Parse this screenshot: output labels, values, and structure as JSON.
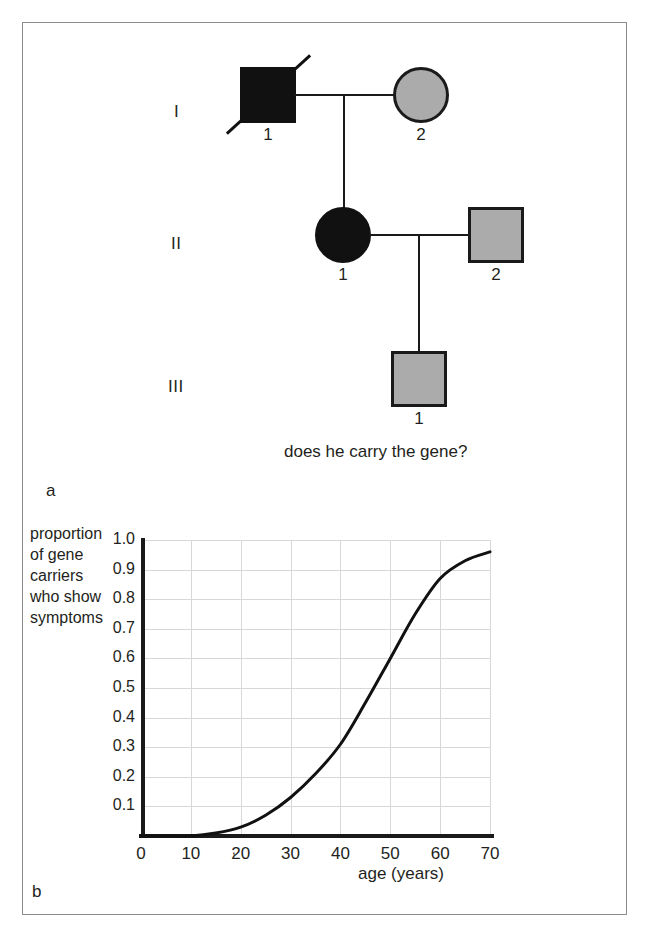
{
  "figure": {
    "panel_a_letter": "a",
    "panel_b_letter": "b",
    "caption": "does he carry the gene?"
  },
  "pedigree": {
    "generations": [
      {
        "label": "I"
      },
      {
        "label": "II"
      },
      {
        "label": "III"
      }
    ],
    "individuals": [
      {
        "generation": "I",
        "id": "1",
        "shape": "square",
        "sex": "male",
        "fill": "black",
        "deceased": true,
        "status": "affected-deceased"
      },
      {
        "generation": "I",
        "id": "2",
        "shape": "circle",
        "sex": "female",
        "fill": "gray",
        "deceased": false,
        "status": "carrier"
      },
      {
        "generation": "II",
        "id": "1",
        "shape": "circle",
        "sex": "female",
        "fill": "black",
        "deceased": false,
        "status": "affected"
      },
      {
        "generation": "II",
        "id": "2",
        "shape": "square",
        "sex": "male",
        "fill": "gray",
        "deceased": false,
        "status": "carrier"
      },
      {
        "generation": "III",
        "id": "1",
        "shape": "square",
        "sex": "male",
        "fill": "gray",
        "deceased": false,
        "status": "unknown"
      }
    ],
    "colors": {
      "affected_fill": "#111111",
      "gray_fill": "#ababab",
      "outline": "#1a1a1a"
    }
  },
  "chart_data": {
    "type": "line",
    "title": "",
    "xlabel": "age (years)",
    "ylabel": "proportion of gene carriers who show symptoms",
    "ylabel_lines": [
      "proportion",
      "of gene",
      "carriers",
      "who show",
      "symptoms"
    ],
    "xlim": [
      0,
      70
    ],
    "ylim": [
      0,
      1.0
    ],
    "grid": true,
    "legend": "none",
    "xticks": [
      "0",
      "10",
      "20",
      "30",
      "40",
      "50",
      "60",
      "70"
    ],
    "xtick_values": [
      0,
      10,
      20,
      30,
      40,
      50,
      60,
      70
    ],
    "yticks": [
      "0.1",
      "0.2",
      "0.3",
      "0.4",
      "0.5",
      "0.6",
      "0.7",
      "0.8",
      "0.9",
      "1.0"
    ],
    "ytick_values": [
      0.1,
      0.2,
      0.3,
      0.4,
      0.5,
      0.6,
      0.7,
      0.8,
      0.9,
      1.0
    ],
    "annotation_mark": ",",
    "series": [
      {
        "name": "proportion of gene carriers showing symptoms",
        "x": [
          0,
          5,
          10,
          15,
          20,
          25,
          30,
          35,
          40,
          45,
          50,
          55,
          60,
          65,
          70
        ],
        "values": [
          0.0,
          0.0,
          0.0,
          0.01,
          0.03,
          0.07,
          0.13,
          0.21,
          0.31,
          0.45,
          0.6,
          0.75,
          0.87,
          0.93,
          0.96
        ]
      }
    ]
  }
}
